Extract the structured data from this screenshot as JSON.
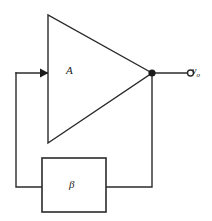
{
  "diagram": {
    "background_color": "#ffffff",
    "line_color": "#2b2b2b",
    "amplifier": {
      "label": "A",
      "shape": "triangle",
      "input_arrow": "input-arrow-icon"
    },
    "feedback_block": {
      "label": "β",
      "shape": "rectangle"
    },
    "output": {
      "terminal": "open-circle-terminal",
      "node": "junction-dot",
      "label_main": "v",
      "label_sub": "o"
    }
  }
}
